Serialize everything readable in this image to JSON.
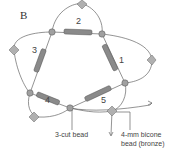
{
  "figure": {
    "panel_label": "B",
    "loop_numbers": [
      "1",
      "2",
      "3",
      "4",
      "5"
    ],
    "callouts": {
      "three_cut": "3-cut bead",
      "bicone_line1": "4-mm bicone",
      "bicone_line2": "bead (bronze)"
    },
    "colors": {
      "thread": "#666666",
      "bugle": "#8a8a8a",
      "bead": "#9a9a9a",
      "bicone": "#a8a8a8"
    }
  }
}
